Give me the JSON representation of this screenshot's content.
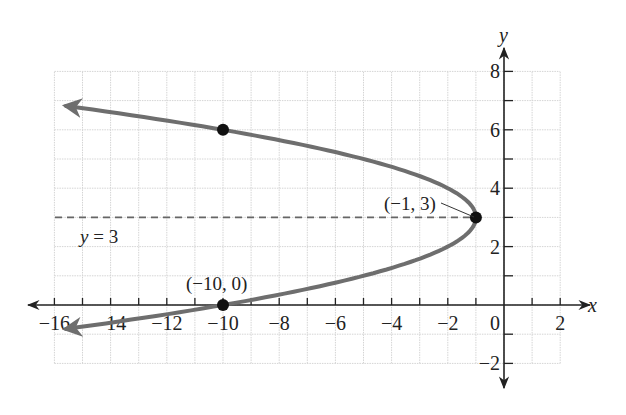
{
  "chart_data": {
    "type": "line",
    "title": "",
    "xlabel": "x",
    "ylabel": "y",
    "xlim": [
      -16,
      2
    ],
    "ylim": [
      -2,
      8
    ],
    "grid": true,
    "x_ticks": [
      -16,
      -14,
      -12,
      -10,
      -8,
      -6,
      -4,
      -2,
      0,
      2
    ],
    "x_tick_labels": [
      "−16",
      "−14",
      "−12",
      "−10",
      "−8",
      "−6",
      "−4",
      "−2",
      "0",
      "2"
    ],
    "y_ticks": [
      -2,
      2,
      4,
      6,
      8
    ],
    "y_tick_labels": [
      "−2",
      "2",
      "4",
      "6",
      "8"
    ],
    "series": [
      {
        "name": "x = -(y - 3)^2 - 1",
        "kind": "parabola-opening-left",
        "vertex": [
          -1,
          3
        ],
        "points": [
          [
            -16.4,
            6.8
          ],
          [
            -10,
            6
          ],
          [
            -5,
            5
          ],
          [
            -2,
            4
          ],
          [
            -1,
            3
          ],
          [
            -2,
            2
          ],
          [
            -5,
            1
          ],
          [
            -10,
            0
          ],
          [
            -16.4,
            -0.8
          ]
        ],
        "color": "#6e6e6e"
      }
    ],
    "marked_points": [
      {
        "x": -10,
        "y": 6,
        "label": ""
      },
      {
        "x": -1,
        "y": 3,
        "label": "(−1, 3)"
      },
      {
        "x": -10,
        "y": 0,
        "label": "(−10, 0)"
      }
    ],
    "reference_lines": [
      {
        "type": "horizontal",
        "y": 3,
        "style": "dashed",
        "label": "y = 3"
      }
    ]
  },
  "labels": {
    "x_axis": "x",
    "y_axis": "y",
    "vertex_label": "(−1, 3)",
    "intercept_label": "(−10, 0)",
    "axis_of_symmetry_var": "y",
    "axis_of_symmetry_rest": " = 3"
  },
  "colors": {
    "curve": "#6e6e6e",
    "axis": "#222222",
    "grid": "#d4d4d4",
    "point": "#111111",
    "dashed": "#666666"
  }
}
